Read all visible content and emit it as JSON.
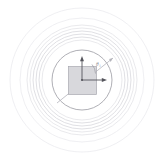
{
  "figure": {
    "background_color": "#ffffff",
    "center": {
      "x": 82,
      "y": 80
    },
    "origin_label": "origin-dot"
  },
  "rings": {
    "description": "Concentric circles centered on the scattering element",
    "colors": {
      "outermost": "#ededf0",
      "cluster": "#e6e6ea",
      "mid": "#dcdce1",
      "inner_boundary": "#9a9aa2"
    },
    "radii": [
      72,
      62,
      55,
      52,
      49,
      46,
      43,
      40,
      30
    ],
    "count_label": "9"
  },
  "element": {
    "name": "square-element",
    "fill_color": "#d8d8dc",
    "stroke_color": "#a8a8b0",
    "x": 68.5,
    "y": 66.5,
    "width": 28,
    "height": 28
  },
  "vectors": {
    "vertical": {
      "name": "y-axis-arrow",
      "label": "",
      "from": {
        "x": 82,
        "y": 80
      },
      "to": {
        "x": 82,
        "y": 58
      },
      "color": "#55555c"
    },
    "horizontal": {
      "name": "x-axis-arrow",
      "label": "",
      "from": {
        "x": 82,
        "y": 80
      },
      "to": {
        "x": 106,
        "y": 80
      },
      "color": "#55555c"
    },
    "diagonal_ray": {
      "name": "incident-ray",
      "label": "",
      "from": {
        "x": 57,
        "y": 103
      },
      "to": {
        "x": 113,
        "y": 58
      },
      "color": "#b4b4bb",
      "angle_degrees": "45"
    }
  },
  "angle": {
    "name": "angle-theta",
    "symbol": "θ",
    "subscript": "i",
    "arc_color": "#9a9aa2",
    "text_color": "#8e8e96",
    "label_x": "96",
    "label_y": "66"
  }
}
